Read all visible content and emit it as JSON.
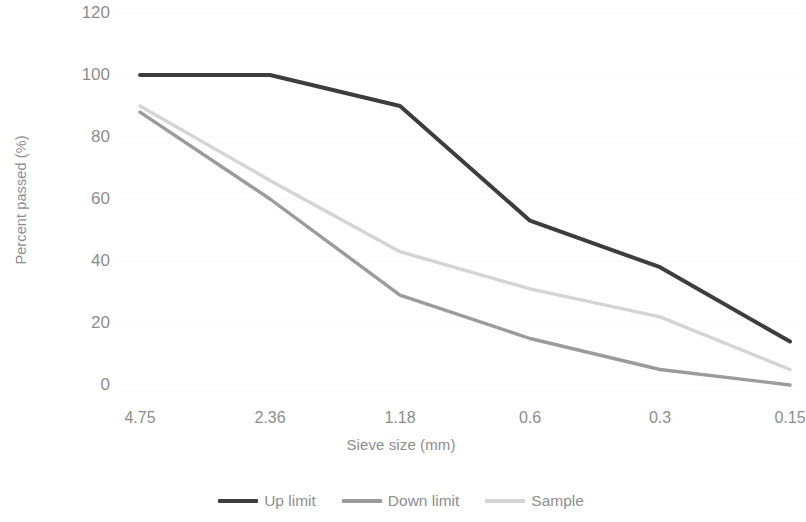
{
  "chart_data": {
    "type": "line",
    "title": "",
    "xlabel": "Sieve size (mm)",
    "ylabel": "Percent passed (%)",
    "categories": [
      "4.75",
      "2.36",
      "1.18",
      "0.6",
      "0.3",
      "0.15"
    ],
    "ylim": [
      0,
      120
    ],
    "yticks": [
      "0",
      "20",
      "40",
      "60",
      "80",
      "100",
      "120"
    ],
    "ytick_values": [
      0,
      20,
      40,
      60,
      80,
      100,
      120
    ],
    "grid": "horizontal-faint",
    "legend_position": "bottom",
    "series": [
      {
        "name": "Up limit",
        "color": "#3d3d3d",
        "values": [
          100,
          100,
          90,
          53,
          38,
          14
        ]
      },
      {
        "name": "Down limit",
        "color": "#9b9b9b",
        "values": [
          88,
          60,
          29,
          15,
          5,
          0
        ]
      },
      {
        "name": "Sample",
        "color": "#d4d4d4",
        "values": [
          90,
          66,
          43,
          31,
          22,
          5
        ]
      }
    ]
  },
  "axes": {
    "y_title": "Percent passed (%)",
    "x_title": "Sieve size (mm)",
    "tick_color": "#8d8d8d"
  },
  "legend": {
    "items": [
      {
        "label": "Up limit",
        "color": "#3d3d3d"
      },
      {
        "label": "Down limit",
        "color": "#9b9b9b"
      },
      {
        "label": "Sample",
        "color": "#d4d4d4"
      }
    ]
  }
}
